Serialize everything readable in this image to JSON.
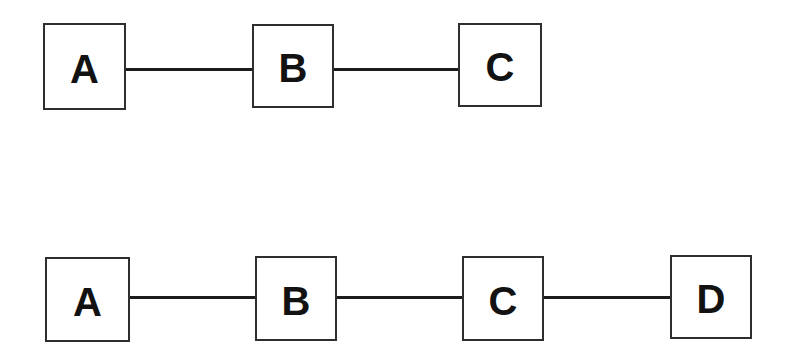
{
  "diagram": {
    "background_color": "#ffffff",
    "node_border_color": "#2e2e2e",
    "edge_color": "#1c1c1c",
    "label_color": "#121212",
    "rows": [
      {
        "name": "top-chain",
        "nodes": [
          {
            "label": "A"
          },
          {
            "label": "B"
          },
          {
            "label": "C"
          }
        ],
        "edges": [
          {
            "from": "A",
            "to": "B"
          },
          {
            "from": "B",
            "to": "C"
          }
        ]
      },
      {
        "name": "bottom-chain",
        "nodes": [
          {
            "label": "A"
          },
          {
            "label": "B"
          },
          {
            "label": "C"
          },
          {
            "label": "D"
          }
        ],
        "edges": [
          {
            "from": "A",
            "to": "B"
          },
          {
            "from": "B",
            "to": "C"
          },
          {
            "from": "C",
            "to": "D"
          }
        ]
      }
    ]
  }
}
